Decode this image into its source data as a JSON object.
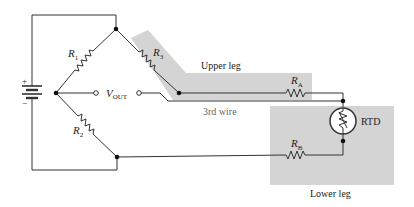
{
  "diagram": {
    "colors": {
      "wire": "#333333",
      "shade": "#d4d4d4",
      "background": "#ffffff"
    },
    "battery": {
      "plus": "+",
      "minus": "−"
    },
    "resistors": {
      "r1": {
        "main": "R",
        "sub": "1"
      },
      "r2": {
        "main": "R",
        "sub": "2"
      },
      "r3": {
        "main": "R",
        "sub": "3"
      },
      "ra": {
        "main": "R",
        "sub": "A"
      },
      "rb": {
        "main": "R",
        "sub": "B"
      }
    },
    "vout": {
      "main": "V",
      "sub": "OUT"
    },
    "labels": {
      "upper_leg": "Upper leg",
      "third_wire": "3rd wire",
      "rtd": "RTD",
      "lower_leg": "Lower leg"
    }
  }
}
